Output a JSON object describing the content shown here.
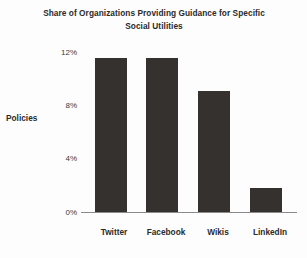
{
  "chart_data": {
    "type": "bar",
    "title": "Share of Organizations Providing Guidance for Specific Social Utilities",
    "title_line1": "Share of Organizations Providing Guidance for Specific",
    "title_line2": "Social Utilities",
    "categories": [
      "Twitter",
      "Facebook",
      "Wikis",
      "LinkedIn"
    ],
    "values": [
      11.1,
      11.1,
      8.7,
      1.7
    ],
    "value_labels": [
      "11.1%",
      "11.1%",
      "8.7%",
      "1.7%"
    ],
    "xlabel": "",
    "ylabel": "Policies",
    "ylim": [
      0,
      12
    ],
    "ytick_values": [
      0,
      4,
      8,
      12
    ],
    "ytick_labels": [
      "0%",
      "4%",
      "8%",
      "12%"
    ],
    "grid": false,
    "legend": false,
    "legend_position": "none",
    "series": [
      {
        "name": "Policies",
        "values": [
          11.1,
          11.1,
          8.7,
          1.7
        ],
        "color": "#34312f"
      }
    ],
    "colors": {
      "bar": "#34312f",
      "axis": "#8b8b8b",
      "text": "#2b2b2b",
      "tick_text": "#3a3a3a",
      "background": "#fdfdfd"
    }
  }
}
